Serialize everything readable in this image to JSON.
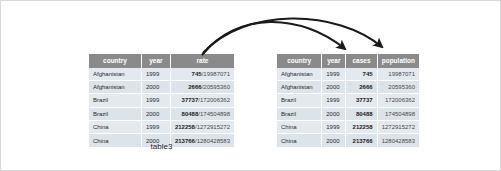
{
  "figure": {
    "caption": "table3",
    "background_color": "#ffffff",
    "border_color": "#d8d8d8",
    "header_fill": "#8a8a8a",
    "header_text_color": "#ffffff",
    "row_fill": "#e4e9ef",
    "row_alt_fill": "#dde3ea",
    "arrow_color": "#1a1a1a"
  },
  "left_table": {
    "name": "table3",
    "headers": [
      "country",
      "year",
      "rate"
    ],
    "rows": [
      {
        "country": "Afghanistan",
        "year": "1999",
        "cases": "745",
        "slash": "/",
        "population": "19987071"
      },
      {
        "country": "Afghanistan",
        "year": "2000",
        "cases": "2666",
        "slash": "/",
        "population": "20595360"
      },
      {
        "country": "Brazil",
        "year": "1999",
        "cases": "37737",
        "slash": "/",
        "population": "172006362"
      },
      {
        "country": "Brazil",
        "year": "2000",
        "cases": "80488",
        "slash": "/",
        "population": "174504898"
      },
      {
        "country": "China",
        "year": "1999",
        "cases": "212258",
        "slash": "/",
        "population": "1272915272"
      },
      {
        "country": "China",
        "year": "2000",
        "cases": "213766",
        "slash": "/",
        "population": "1280428583"
      }
    ]
  },
  "right_table": {
    "headers": [
      "country",
      "year",
      "cases",
      "population"
    ],
    "rows": [
      {
        "country": "Afghanistan",
        "year": "1999",
        "cases": "745",
        "population": "19987071"
      },
      {
        "country": "Afghanistan",
        "year": "2000",
        "cases": "2666",
        "population": "20595360"
      },
      {
        "country": "Brazil",
        "year": "1999",
        "cases": "37737",
        "population": "172006362"
      },
      {
        "country": "Brazil",
        "year": "2000",
        "cases": "80488",
        "population": "174504898"
      },
      {
        "country": "China",
        "year": "1999",
        "cases": "212258",
        "population": "1272915272"
      },
      {
        "country": "China",
        "year": "2000",
        "cases": "213766",
        "population": "1280428583"
      }
    ]
  },
  "arrows": [
    {
      "label": "rate-to-cases",
      "from": "rate",
      "to": "cases"
    },
    {
      "label": "rate-to-population",
      "from": "rate",
      "to": "population"
    }
  ]
}
